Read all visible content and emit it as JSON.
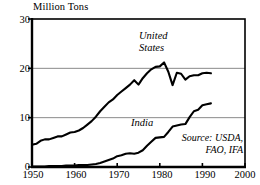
{
  "chart_data": {
    "type": "line",
    "title": "",
    "ylabel": "Million Tons",
    "xlabel": "",
    "xlim": [
      1950,
      2000
    ],
    "ylim": [
      0,
      30
    ],
    "grid": true,
    "legend_position": "inline-annotations",
    "yticks": [
      0,
      10,
      20,
      30
    ],
    "xticks": [
      1950,
      1960,
      1970,
      1980,
      1990,
      2000
    ],
    "ytick_labels": [
      "0",
      "10",
      "20",
      "30"
    ],
    "xtick_labels": [
      "1950",
      "1960",
      "1970",
      "1980",
      "1990",
      "2000"
    ],
    "annotations": [
      {
        "name": "united-states-label",
        "text": "United States",
        "line1": "United",
        "line2": "States"
      },
      {
        "name": "india-label",
        "text": "India"
      },
      {
        "name": "source-note",
        "line1": "Source: USDA,",
        "line2": "FAO, IFA"
      }
    ],
    "series": [
      {
        "name": "United States",
        "color": "#000000",
        "x": [
          1950,
          1951,
          1952,
          1953,
          1954,
          1955,
          1956,
          1957,
          1958,
          1959,
          1960,
          1961,
          1962,
          1963,
          1964,
          1965,
          1966,
          1967,
          1968,
          1969,
          1970,
          1971,
          1972,
          1973,
          1974,
          1975,
          1976,
          1977,
          1978,
          1979,
          1980,
          1981,
          1982,
          1983,
          1984,
          1985,
          1986,
          1987,
          1988,
          1989,
          1990,
          1991,
          1992
        ],
        "values": [
          4.5,
          4.7,
          5.3,
          5.6,
          5.6,
          5.9,
          6.2,
          6.2,
          6.6,
          7.0,
          7.1,
          7.4,
          7.9,
          8.6,
          9.3,
          10.2,
          11.3,
          12.2,
          13.1,
          13.7,
          14.6,
          15.3,
          16.0,
          16.7,
          17.6,
          16.7,
          18.0,
          19.0,
          19.8,
          20.3,
          20.4,
          21.2,
          19.3,
          16.6,
          19.1,
          18.9,
          17.7,
          18.4,
          18.6,
          18.6,
          19.0,
          19.1,
          19.0
        ]
      },
      {
        "name": "India",
        "color": "#000000",
        "x": [
          1950,
          1951,
          1952,
          1953,
          1954,
          1955,
          1956,
          1957,
          1958,
          1959,
          1960,
          1961,
          1962,
          1963,
          1964,
          1965,
          1966,
          1967,
          1968,
          1969,
          1970,
          1971,
          1972,
          1973,
          1974,
          1975,
          1976,
          1977,
          1978,
          1979,
          1980,
          1981,
          1982,
          1983,
          1984,
          1985,
          1986,
          1987,
          1988,
          1989,
          1990,
          1991,
          1992
        ],
        "values": [
          0.1,
          0.1,
          0.1,
          0.1,
          0.2,
          0.2,
          0.2,
          0.2,
          0.3,
          0.3,
          0.3,
          0.4,
          0.4,
          0.4,
          0.5,
          0.6,
          0.8,
          1.1,
          1.4,
          1.7,
          2.2,
          2.4,
          2.7,
          2.8,
          2.7,
          2.9,
          3.4,
          4.3,
          5.1,
          5.9,
          6.0,
          6.1,
          7.1,
          8.2,
          8.4,
          8.6,
          8.7,
          10.1,
          11.3,
          11.6,
          12.5,
          12.7,
          12.9
        ]
      }
    ]
  },
  "style": {
    "axis_color": "#000000",
    "grid_color": "#8a8a8a",
    "background": "#ffffff",
    "line_color": "#000000"
  }
}
